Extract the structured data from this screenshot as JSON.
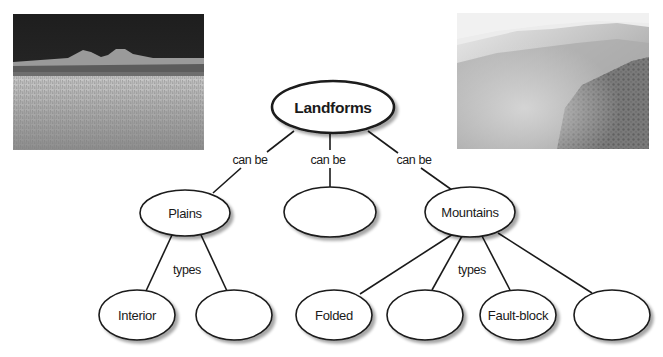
{
  "photos": [
    {
      "id": "plains-photo",
      "subject": "grassland plain with distant buttes under a dark sky",
      "tone": "grayscale"
    },
    {
      "id": "mountains-photo",
      "subject": "forested mountain slopes shrouded in mist",
      "tone": "grayscale"
    }
  ],
  "concept_map": {
    "root": {
      "label": "Landforms"
    },
    "root_link_label": "can be",
    "level1": [
      {
        "id": "plains",
        "label": "Plains",
        "link_label": "can be"
      },
      {
        "id": "blank-1",
        "label": "",
        "link_label": "can be"
      },
      {
        "id": "mountains",
        "label": "Mountains",
        "link_label": "can be"
      }
    ],
    "plains_types_label": "types",
    "plains_children": [
      {
        "id": "interior",
        "label": "Interior"
      },
      {
        "id": "plains-blank",
        "label": ""
      }
    ],
    "mountains_types_label": "types",
    "mountains_children": [
      {
        "id": "folded",
        "label": "Folded"
      },
      {
        "id": "mountains-blank-1",
        "label": ""
      },
      {
        "id": "fault-block",
        "label": "Fault-block"
      },
      {
        "id": "mountains-blank-2",
        "label": ""
      }
    ]
  },
  "colors": {
    "stroke": "#1a1a1a",
    "fill": "#ffffff",
    "shadow": "#bdbdbd"
  }
}
